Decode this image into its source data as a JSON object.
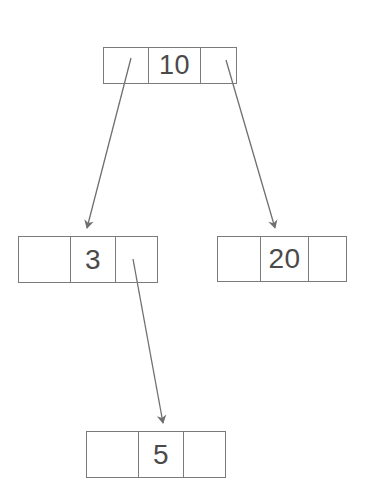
{
  "diagram": {
    "kind": "binary-search-tree",
    "background_color": "#ffffff",
    "stroke_color": "#7b7b7b",
    "text_color": "#4a4a4a",
    "arrow_color": "#6f6f6f",
    "nodes": [
      {
        "id": "root",
        "key": "10",
        "left_pointer": "",
        "right_pointer": ""
      },
      {
        "id": "left",
        "key": "3",
        "left_pointer": "",
        "right_pointer": ""
      },
      {
        "id": "right",
        "key": "20",
        "left_pointer": "",
        "right_pointer": ""
      },
      {
        "id": "grandchild",
        "key": "5",
        "left_pointer": "",
        "right_pointer": ""
      }
    ],
    "edges": [
      {
        "id": "root-to-left",
        "from": "root",
        "to": "left",
        "from_x": 131,
        "from_y": 58,
        "to_x": 86,
        "to_y": 233
      },
      {
        "id": "root-to-right",
        "from": "root",
        "to": "right",
        "from_x": 226,
        "from_y": 60,
        "to_x": 276,
        "to_y": 233
      },
      {
        "id": "left-to-grandchild",
        "from": "left",
        "to": "grandchild",
        "from_x": 133,
        "from_y": 259,
        "to_x": 164,
        "to_y": 428
      }
    ]
  }
}
